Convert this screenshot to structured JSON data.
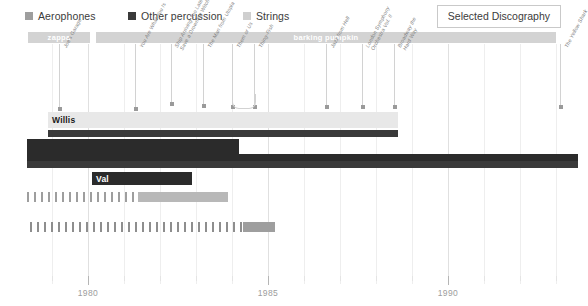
{
  "legend": {
    "items": [
      {
        "label": "Aerophones",
        "color": "#9e9e9e",
        "x": 25
      },
      {
        "label": "Other percussion",
        "color": "#3a3a3a",
        "x": 128
      },
      {
        "label": "Strings",
        "color": "#cfcfcf",
        "x": 243
      }
    ]
  },
  "disco_button": {
    "label": "Selected Discography"
  },
  "label_bars": [
    {
      "name": "zappa",
      "left": 28,
      "width": 62,
      "color": "#d3d3d3"
    },
    {
      "name": "barking pumpkin",
      "left": 96,
      "width": 460,
      "color": "#d3d3d3"
    }
  ],
  "chart_data": {
    "type": "bar",
    "title": "Selected Discography",
    "xlabel": "",
    "ylabel": "",
    "xlim": [
      1978.3,
      1993.6
    ],
    "xticks": [
      1980,
      1985,
      1990
    ],
    "xticklabels": [
      "1980",
      "1985",
      "1990"
    ],
    "grid": true,
    "legend_position": "top-left",
    "series": [
      {
        "name": "Strings",
        "color": "#e8e8e8",
        "label": "Willis",
        "label_color": "#1a1a1a",
        "start": 1978.9,
        "end": 1988.6,
        "row": 0
      },
      {
        "name": "Other percussion",
        "color": "#3a3a3a",
        "label": "",
        "label_color": "#ffffff",
        "start": 1978.9,
        "end": 1988.6,
        "row": 1
      },
      {
        "name": "Other percussion",
        "color": "#2b2b2b",
        "label": "",
        "label_color": "#ffffff",
        "start": 1978.3,
        "end": 1984.2,
        "row": 2
      },
      {
        "name": "Other percussion",
        "color": "#2b2b2b",
        "label": "",
        "label_color": "#ffffff",
        "start": 1978.3,
        "end": 1993.6,
        "row": 3
      },
      {
        "name": "Other percussion",
        "color": "#3a3a3a",
        "label": "",
        "label_color": "#ffffff",
        "start": 1978.3,
        "end": 1993.6,
        "row": 4
      },
      {
        "name": "Other percussion",
        "color": "#2b2b2b",
        "label": "Val",
        "label_color": "#ffffff",
        "start": 1980.1,
        "end": 1982.9,
        "row": 5
      },
      {
        "name": "Strings",
        "color": "#b8b8b8",
        "label": "",
        "label_color": "#ffffff",
        "start": 1981.4,
        "end": 1983.9,
        "row": 6
      },
      {
        "name": "Strings",
        "color": "#9e9e9e",
        "label": "",
        "label_color": "#ffffff",
        "start": 1984.3,
        "end": 1985.2,
        "row": 7
      }
    ],
    "dashed_rows": [
      {
        "row": 6,
        "start": 1978.3,
        "end": 1981.4,
        "color": "#9e9e9e"
      },
      {
        "row": 7,
        "start": 1978.4,
        "end": 1984.3,
        "color": "#8e8e8e"
      }
    ],
    "annotations": [
      {
        "label": "Joe's Garage",
        "year": 1979.2,
        "stem": 65,
        "lines": 1
      },
      {
        "label": "You Are What You Is",
        "year": 1981.3,
        "stem": 65,
        "lines": 1
      },
      {
        "label": "Ship Arriving Too Late to|Save a Drowning Witch",
        "year": 1982.3,
        "stem": 60,
        "lines": 2
      },
      {
        "label": "The Man from Utopia",
        "year": 1983.2,
        "stem": 62,
        "lines": 1
      },
      {
        "label": "Them or Us",
        "year": 1984.0,
        "stem": 63,
        "lines": 1
      },
      {
        "label": "Thing-Fish",
        "year": 1984.6,
        "stem": 63,
        "lines": 1
      },
      {
        "label": "Jazz from Hell",
        "year": 1986.6,
        "stem": 63,
        "lines": 1
      },
      {
        "label": "London Symphony|Orchestra Vol. II",
        "year": 1987.6,
        "stem": 63,
        "lines": 2
      },
      {
        "label": "Broadway the|Hard Way",
        "year": 1988.5,
        "stem": 63,
        "lines": 2
      },
      {
        "label": "The Yellow Shark",
        "year": 1993.1,
        "stem": 63,
        "lines": 1
      }
    ]
  }
}
